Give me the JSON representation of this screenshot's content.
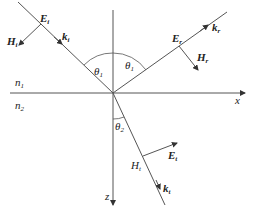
{
  "diagram": {
    "type": "electromagnetic wave reflection and refraction at interface",
    "axes": {
      "x_label": "x",
      "z_label": "z"
    },
    "media": {
      "upper": {
        "symbol": "n",
        "sub": "1"
      },
      "lower": {
        "symbol": "n",
        "sub": "2"
      }
    },
    "angles": {
      "incident": {
        "symbol": "θ",
        "sub": "1"
      },
      "reflected": {
        "symbol": "θ",
        "sub": "1"
      },
      "transmitted": {
        "symbol": "θ",
        "sub": "2"
      }
    },
    "incident_wave": {
      "E": {
        "symbol": "E",
        "sub": "i"
      },
      "H": {
        "symbol": "H",
        "sub": "i"
      },
      "k": {
        "symbol": "k",
        "sub": "i"
      }
    },
    "reflected_wave": {
      "E": {
        "symbol": "E",
        "sub": "r"
      },
      "H": {
        "symbol": "H",
        "sub": "r"
      },
      "k": {
        "symbol": "k",
        "sub": "r"
      }
    },
    "transmitted_wave": {
      "E": {
        "symbol": "E",
        "sub": "t"
      },
      "H": {
        "symbol": "H",
        "sub": "t"
      },
      "k": {
        "symbol": "k",
        "sub": "t"
      }
    },
    "colors": {
      "line": "#555555",
      "text": "#222222"
    }
  }
}
